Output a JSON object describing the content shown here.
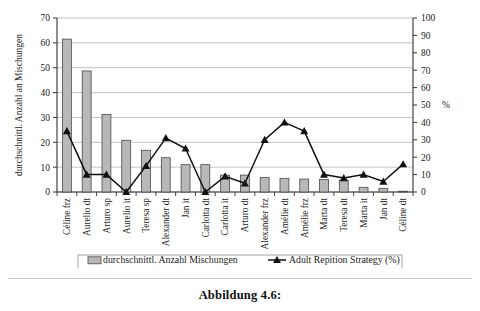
{
  "caption": "Abbildung 4.6:",
  "axes": {
    "left_title": "durchschnittl. Anzahl an Mischungen",
    "left_ticks": [
      "0",
      "10",
      "20",
      "30",
      "40",
      "50",
      "60",
      "70"
    ],
    "right_ticks": [
      "0",
      "10",
      "20",
      "30",
      "40",
      "50",
      "60",
      "70",
      "80",
      "90",
      "100"
    ],
    "right_unit": "%"
  },
  "legend": {
    "bar_label": "durchschnittl. Anzahl Mischungen",
    "line_label": "Adult Repition Strategy (%)"
  },
  "colors": {
    "bar_fill": "#b8b8b8",
    "bar_stroke": "#4a4a4a",
    "line": "#111111",
    "grid": "#b4b4b4",
    "axis": "#333333"
  },
  "chart_data": {
    "type": "bar",
    "title": "",
    "xlabel": "",
    "ylabel": "durchschnittl. Anzahl an Mischungen",
    "ylim": [
      0,
      70
    ],
    "y2label": "%",
    "y2lim": [
      0,
      100
    ],
    "grid": true,
    "legend_position": "bottom",
    "categories": [
      "Céline frz",
      "Aurelio dt",
      "Arturo sp",
      "Aurelio it",
      "Teresa sp",
      "Alexander dt",
      "Jan it",
      "Carlotta dt",
      "Carlotta it",
      "Arturo dt",
      "Alexander frz",
      "Amélie dt",
      "Amélie frz",
      "Marta dt",
      "Teresa dt",
      "Marta it",
      "Jan dt",
      "Céline dt"
    ],
    "series": [
      {
        "name": "durchschnittl. Anzahl Mischungen",
        "type": "bar",
        "axis": "left",
        "values": [
          61.5,
          48.7,
          31.2,
          20.8,
          16.8,
          13.8,
          11.0,
          11.0,
          6.8,
          6.8,
          5.8,
          5.5,
          5.2,
          5.0,
          4.8,
          1.9,
          1.5,
          0.3
        ]
      },
      {
        "name": "Adult Repition Strategy (%)",
        "type": "line",
        "axis": "right",
        "values": [
          35,
          10,
          10,
          0,
          15,
          31,
          25,
          0,
          9,
          5,
          30,
          40,
          35,
          10,
          8,
          10,
          6,
          16
        ]
      }
    ]
  }
}
